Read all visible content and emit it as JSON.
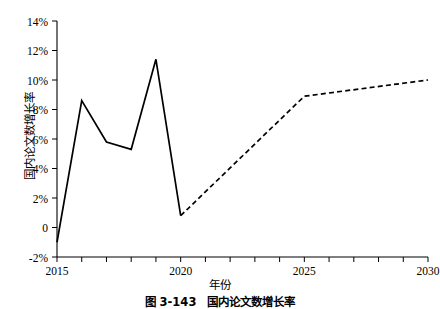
{
  "figure": {
    "caption": "图 3-143　国内论文数增长率",
    "xlabel": "年份",
    "ylabel": "国内论文数增长率"
  },
  "axes": {
    "y_ticks": [
      "-2%",
      "0",
      "2%",
      "4%",
      "6%",
      "8%",
      "10%",
      "12%",
      "14%"
    ],
    "x_ticks_major": [
      "2015",
      "2020",
      "2025",
      "2030"
    ]
  },
  "chart_data": {
    "type": "line",
    "title": "图 3-143　国内论文数增长率",
    "xlabel": "年份",
    "ylabel": "国内论文数增长率",
    "xlim": [
      2015,
      2030
    ],
    "ylim": [
      -2,
      14
    ],
    "ytick_values": [
      -2,
      0,
      2,
      4,
      6,
      8,
      10,
      12,
      14
    ],
    "ytick_labels": [
      "-2%",
      "0",
      "2%",
      "4%",
      "6%",
      "8%",
      "10%",
      "12%",
      "14%"
    ],
    "xtick_values": [
      2015,
      2016,
      2017,
      2018,
      2019,
      2020,
      2021,
      2022,
      2023,
      2024,
      2025,
      2026,
      2027,
      2028,
      2029,
      2030
    ],
    "xtick_labels_shown": [
      "2015",
      "2020",
      "2025",
      "2030"
    ],
    "grid": false,
    "legend": "none",
    "series": [
      {
        "name": "历史值",
        "style": "solid",
        "color": "#000000",
        "x": [
          2015,
          2016,
          2017,
          2018,
          2019,
          2020
        ],
        "values": [
          -1.0,
          8.6,
          5.8,
          5.3,
          11.4,
          0.8
        ]
      },
      {
        "name": "预测值",
        "style": "dashed",
        "color": "#000000",
        "x": [
          2020,
          2025,
          2030
        ],
        "values": [
          0.8,
          8.9,
          10.0
        ]
      }
    ]
  }
}
